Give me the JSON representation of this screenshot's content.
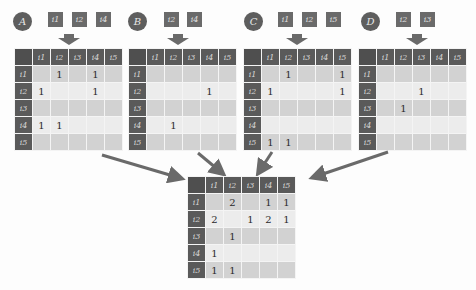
{
  "diagram": {
    "column_headers": [
      "i1",
      "i2",
      "i3",
      "i4",
      "i5"
    ],
    "row_headers": [
      "i1",
      "i2",
      "i3",
      "i4",
      "i5"
    ],
    "colors": {
      "header_bg": "#5a5a5a",
      "row_odd": "#d2d2d2",
      "row_even": "#ececec",
      "arrow": "#6a6a6a"
    },
    "sources": [
      {
        "label": "A",
        "items": [
          "i1",
          "i2",
          "i4"
        ],
        "matrix": [
          [
            "",
            "1",
            "",
            "1",
            ""
          ],
          [
            "1",
            "",
            "",
            "1",
            ""
          ],
          [
            "",
            "",
            "",
            "",
            ""
          ],
          [
            "1",
            "1",
            "",
            "",
            ""
          ],
          [
            "",
            "",
            "",
            "",
            ""
          ]
        ]
      },
      {
        "label": "B",
        "items": [
          "i2",
          "i4"
        ],
        "matrix": [
          [
            "",
            "",
            "",
            "",
            ""
          ],
          [
            "",
            "",
            "",
            "1",
            ""
          ],
          [
            "",
            "",
            "",
            "",
            ""
          ],
          [
            "",
            "1",
            "",
            "",
            ""
          ],
          [
            "",
            "",
            "",
            "",
            ""
          ]
        ]
      },
      {
        "label": "C",
        "items": [
          "i1",
          "i2",
          "i5"
        ],
        "matrix": [
          [
            "",
            "1",
            "",
            "",
            "1"
          ],
          [
            "1",
            "",
            "",
            "",
            "1"
          ],
          [
            "",
            "",
            "",
            "",
            ""
          ],
          [
            "",
            "",
            "",
            "",
            ""
          ],
          [
            "1",
            "1",
            "",
            "",
            ""
          ]
        ]
      },
      {
        "label": "D",
        "items": [
          "i2",
          "i3"
        ],
        "matrix": [
          [
            "",
            "",
            "",
            "",
            ""
          ],
          [
            "",
            "",
            "1",
            "",
            ""
          ],
          [
            "",
            "1",
            "",
            "",
            ""
          ],
          [
            "",
            "",
            "",
            "",
            ""
          ],
          [
            "",
            "",
            "",
            "",
            ""
          ]
        ]
      }
    ],
    "result": {
      "matrix": [
        [
          "",
          "2",
          "",
          "1",
          "1"
        ],
        [
          "2",
          "",
          "1",
          "2",
          "1"
        ],
        [
          "",
          "1",
          "",
          "",
          ""
        ],
        [
          "1",
          "",
          "",
          "",
          ""
        ],
        [
          "1",
          "1",
          "",
          "",
          ""
        ]
      ]
    }
  }
}
